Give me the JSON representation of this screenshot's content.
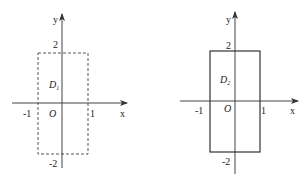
{
  "diagrams": [
    {
      "id": "left",
      "region_label": "D",
      "region_subscript": "1",
      "border_style": "dashed",
      "axis_x_label": "x",
      "axis_y_label": "y",
      "origin_label": "O",
      "ticks": {
        "x_neg": "-1",
        "x_pos": "1",
        "y_pos": "2",
        "y_neg": "-2"
      },
      "region": {
        "x_min": -1,
        "x_max": 1,
        "y_min": -2,
        "y_max": 2
      }
    },
    {
      "id": "right",
      "region_label": "D",
      "region_subscript": "2",
      "border_style": "solid",
      "axis_x_label": "x",
      "axis_y_label": "y",
      "origin_label": "O",
      "ticks": {
        "x_neg": "-1",
        "x_pos": "1",
        "y_pos": "2",
        "y_neg": "-2"
      },
      "region": {
        "x_min": -1,
        "x_max": 1,
        "y_min": -2,
        "y_max": 2
      }
    }
  ],
  "colors": {
    "stroke": "#333333",
    "text": "#222222"
  }
}
